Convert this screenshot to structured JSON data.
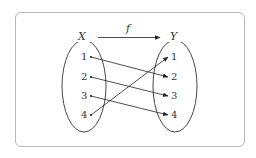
{
  "diagram": {
    "function_label": "f",
    "domain": {
      "name": "X",
      "elements": [
        "1",
        "2",
        "3",
        "4"
      ]
    },
    "codomain": {
      "name": "Y",
      "elements": [
        "1",
        "2",
        "3",
        "4"
      ]
    },
    "mappings": [
      {
        "from": "1",
        "to": "2"
      },
      {
        "from": "2",
        "to": "3"
      },
      {
        "from": "3",
        "to": "4"
      },
      {
        "from": "4",
        "to": "1"
      }
    ]
  }
}
